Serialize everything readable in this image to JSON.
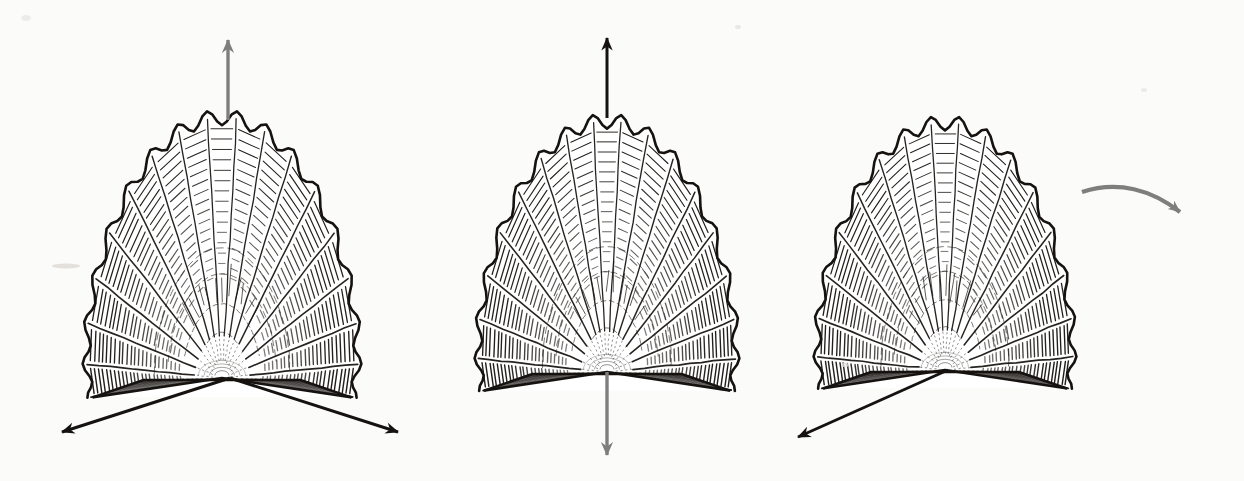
{
  "figure": {
    "background_color": "#fbfbfa",
    "ink_color": "#15120f",
    "grey_arrow_color": "#7e7e7e",
    "width": 1244,
    "height": 481,
    "panel_count": 3
  },
  "panels": [
    {
      "id": "panel-1",
      "label": "Shell with vertical mirror axis and two diagonal arrows",
      "shell": {
        "name": "scallop-shell",
        "center_x": 222,
        "hinge_y": 378,
        "radius_x": 140,
        "radius_y": 135,
        "rib_count": 17
      },
      "arrows": [
        {
          "name": "arrow-up",
          "color": "#7e7e7e",
          "style": "straight",
          "x1": 228,
          "y1": 120,
          "x2": 228,
          "y2": 40,
          "head": "barbed"
        },
        {
          "name": "arrow-down-left",
          "color": "#15120f",
          "style": "straight",
          "x1": 230,
          "y1": 378,
          "x2": 62,
          "y2": 432,
          "head": "barbed"
        },
        {
          "name": "arrow-down-right",
          "color": "#15120f",
          "style": "straight",
          "x1": 230,
          "y1": 378,
          "x2": 398,
          "y2": 432,
          "head": "barbed"
        }
      ]
    },
    {
      "id": "panel-2",
      "label": "Shell with full vertical axis, black up arrow and grey down arrow",
      "shell": {
        "name": "scallop-shell",
        "center_x": 607,
        "hinge_y": 372,
        "radius_x": 133,
        "radius_y": 130,
        "rib_count": 17
      },
      "arrows": [
        {
          "name": "arrow-up",
          "color": "#15120f",
          "style": "straight",
          "x1": 607,
          "y1": 118,
          "x2": 607,
          "y2": 38,
          "head": "barbed"
        },
        {
          "name": "arrow-down",
          "color": "#7e7e7e",
          "style": "straight",
          "x1": 607,
          "y1": 372,
          "x2": 607,
          "y2": 455,
          "head": "barbed"
        }
      ]
    },
    {
      "id": "panel-3",
      "label": "Shell with single black diagonal arrow and grey curved rotation arrow",
      "shell": {
        "name": "scallop-shell",
        "center_x": 945,
        "hinge_y": 370,
        "radius_x": 132,
        "radius_y": 128,
        "rib_count": 17
      },
      "arrows": [
        {
          "name": "arrow-down-left",
          "color": "#15120f",
          "style": "straight",
          "x1": 948,
          "y1": 370,
          "x2": 798,
          "y2": 437,
          "head": "barbed"
        },
        {
          "name": "arrow-curved-right",
          "color": "#7e7e7e",
          "style": "curved",
          "path": "M 1082,192 C 1118,180 1152,190 1180,212",
          "head": "barbed"
        }
      ]
    }
  ],
  "annotations": {
    "smudge_left": "faint pencil smudge at left margin",
    "speck_count": 4
  }
}
